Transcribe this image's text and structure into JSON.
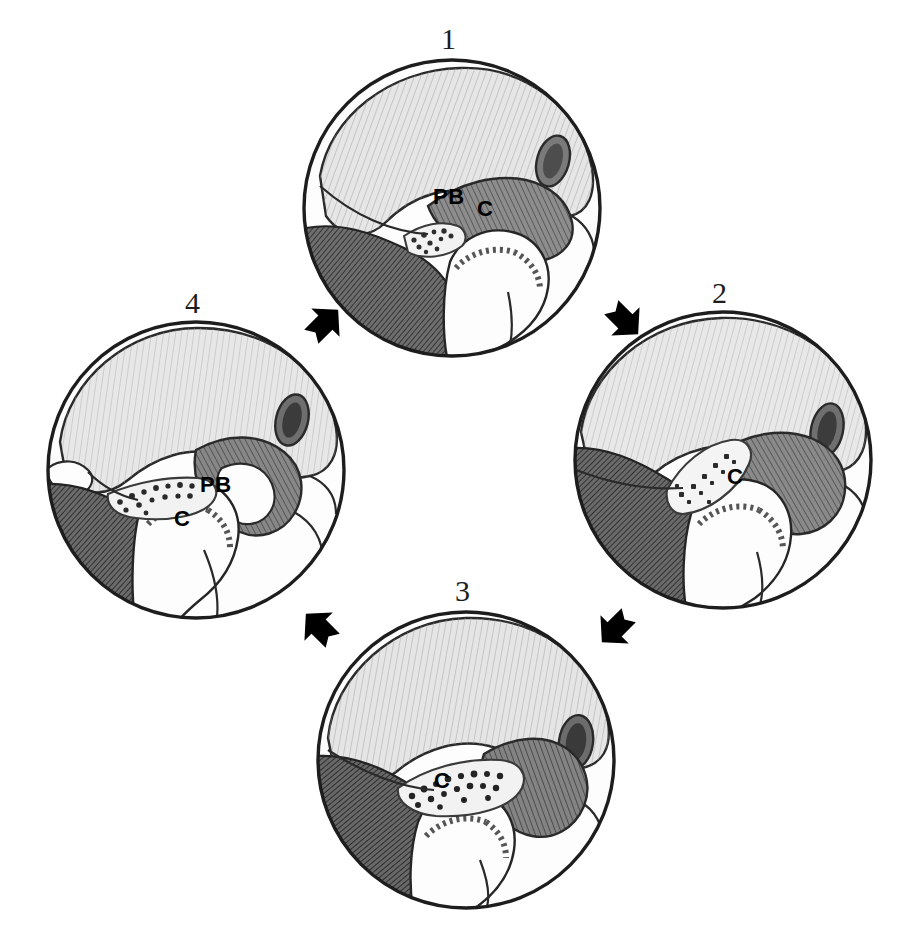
{
  "figure": {
    "background_color": "#ffffff",
    "ink_color": "#1d1d1d",
    "width": 900,
    "height": 938
  },
  "panels": [
    {
      "id": "panel-1",
      "number": "1",
      "number_pos": {
        "x": 441,
        "y": 24
      },
      "circle": {
        "cx": 452,
        "cy": 208,
        "r": 152
      },
      "labels": [
        {
          "id": "label-pb-1",
          "text": "PB",
          "x": 433,
          "y": 186
        },
        {
          "id": "label-c-1",
          "text": "C",
          "x": 477,
          "y": 198
        }
      ]
    },
    {
      "id": "panel-2",
      "number": "2",
      "number_pos": {
        "x": 712,
        "y": 278
      },
      "circle": {
        "cx": 723,
        "cy": 460,
        "r": 152
      },
      "labels": [
        {
          "id": "label-c-2",
          "text": "C",
          "x": 727,
          "y": 466
        }
      ]
    },
    {
      "id": "panel-3",
      "number": "3",
      "number_pos": {
        "x": 455,
        "y": 576
      },
      "circle": {
        "cx": 466,
        "cy": 760,
        "r": 152
      },
      "labels": [
        {
          "id": "label-c-3",
          "text": "C",
          "x": 434,
          "y": 770
        }
      ]
    },
    {
      "id": "panel-4",
      "number": "4",
      "number_pos": {
        "x": 185,
        "y": 288
      },
      "circle": {
        "cx": 196,
        "cy": 470,
        "r": 152
      },
      "labels": [
        {
          "id": "label-pb-4",
          "text": "PB",
          "x": 200,
          "y": 474
        },
        {
          "id": "label-c-4",
          "text": "C",
          "x": 174,
          "y": 508
        }
      ]
    }
  ],
  "arrows": [
    {
      "id": "arrow-1-to-2",
      "from": "1",
      "to": "2",
      "direction": "down-right",
      "x": 596,
      "y": 292,
      "rotation": 45
    },
    {
      "id": "arrow-2-to-3",
      "from": "2",
      "to": "3",
      "direction": "down-left",
      "x": 588,
      "y": 600,
      "rotation": 135
    },
    {
      "id": "arrow-3-to-4",
      "from": "3",
      "to": "4",
      "direction": "up-left",
      "x": 292,
      "y": 600,
      "rotation": 225
    },
    {
      "id": "arrow-4-to-1",
      "from": "4",
      "to": "1",
      "direction": "up-right",
      "x": 296,
      "y": 296,
      "rotation": 315
    }
  ],
  "legend": {
    "pb_meaning": "PB",
    "c_meaning": "C"
  },
  "colors": {
    "outline": "#1d1d1d",
    "light_shade": "#e3e3e3",
    "mid_shade": "#b9b9b9",
    "dark_shade": "#5c5c5c",
    "darker_shade": "#3a3a3a",
    "white": "#fdfdfd",
    "arrow_fill": "#000000"
  }
}
